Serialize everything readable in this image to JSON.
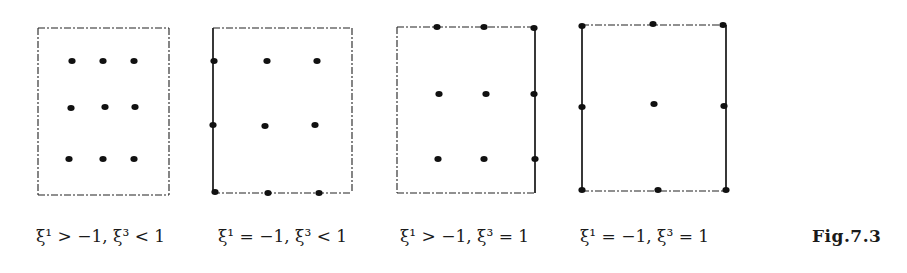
{
  "figure": {
    "label": "Fig.7.3",
    "stroke_color": "#222222",
    "dot_color": "#111111",
    "panels": [
      {
        "caption": "ξ¹ > −1,  ξ³ < 1",
        "box": {
          "x": 38,
          "y": 28,
          "w": 131,
          "h": 167
        },
        "solid_edges": [],
        "dots": [
          [
            72,
            61
          ],
          [
            103,
            61
          ],
          [
            134,
            61
          ],
          [
            71,
            108
          ],
          [
            105,
            107
          ],
          [
            135,
            107
          ],
          [
            69,
            159
          ],
          [
            103,
            159
          ],
          [
            134,
            159
          ]
        ]
      },
      {
        "caption": "ξ¹ = −1,  ξ³ < 1",
        "box": {
          "x": 213,
          "y": 28,
          "w": 139,
          "h": 165
        },
        "solid_edges": [
          "left"
        ],
        "dots": [
          [
            214,
            61
          ],
          [
            267,
            61
          ],
          [
            317,
            61
          ],
          [
            213,
            125
          ],
          [
            265,
            126
          ],
          [
            315,
            125
          ],
          [
            215,
            192
          ],
          [
            268,
            193
          ],
          [
            319,
            193
          ]
        ]
      },
      {
        "caption": "ξ¹ > −1,  ξ³ = 1",
        "box": {
          "x": 397,
          "y": 27,
          "w": 138,
          "h": 166
        },
        "solid_edges": [
          "right"
        ],
        "dots": [
          [
            437,
            27
          ],
          [
            484,
            27
          ],
          [
            534,
            28
          ],
          [
            439,
            94
          ],
          [
            486,
            94
          ],
          [
            534,
            94
          ],
          [
            438,
            159
          ],
          [
            484,
            159
          ],
          [
            535,
            159
          ]
        ]
      },
      {
        "caption": "ξ¹ = −1,  ξ³ = 1",
        "box": {
          "x": 582,
          "y": 25,
          "w": 144,
          "h": 166
        },
        "solid_edges": [
          "left",
          "right"
        ],
        "dots": [
          [
            582,
            26
          ],
          [
            653,
            24
          ],
          [
            723,
            25
          ],
          [
            582,
            107
          ],
          [
            654,
            104
          ],
          [
            724,
            106
          ],
          [
            582,
            190
          ],
          [
            658,
            190
          ],
          [
            726,
            190
          ]
        ]
      }
    ],
    "caption_x": [
      36,
      218,
      400,
      580
    ]
  }
}
